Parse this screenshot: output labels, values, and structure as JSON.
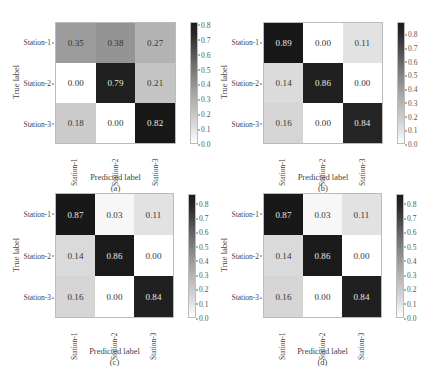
{
  "chart_data": [
    {
      "type": "heatmap",
      "panel": "(a)",
      "title": "",
      "xlabel": "Predicted label",
      "ylabel": "True label",
      "caption": "(a)",
      "x_categories": [
        "Station-1",
        "Station-2",
        "Station-3"
      ],
      "y_categories": [
        "Station-1",
        "Station-2",
        "Station-3"
      ],
      "values": [
        [
          0.35,
          0.38,
          0.27
        ],
        [
          0.0,
          0.79,
          0.21
        ],
        [
          0.18,
          0.0,
          0.82
        ]
      ],
      "display": [
        [
          "0.35",
          "0.38",
          "0.27"
        ],
        [
          "0.00",
          "0.79",
          "0.21"
        ],
        [
          "0.18",
          "0.00",
          "0.82"
        ]
      ],
      "colorbar": {
        "min": 0.0,
        "max": 0.82,
        "ticks": [
          "0.0",
          "0.1",
          "0.2",
          "0.3",
          "0.4",
          "0.5",
          "0.6",
          "0.7",
          "0.8"
        ],
        "cmap": "Greys"
      }
    },
    {
      "type": "heatmap",
      "panel": "(b)",
      "title": "",
      "xlabel": "Predicted label",
      "ylabel": "True label",
      "caption": "(b)",
      "x_categories": [
        "Station-1",
        "Station-2",
        "Station-3"
      ],
      "y_categories": [
        "Station-1",
        "Station-2",
        "Station-3"
      ],
      "values": [
        [
          0.89,
          0.0,
          0.11
        ],
        [
          0.14,
          0.86,
          0.0
        ],
        [
          0.16,
          0.0,
          0.84
        ]
      ],
      "display": [
        [
          "0.89",
          "0.00",
          "0.11"
        ],
        [
          "0.14",
          "0.86",
          "0.00"
        ],
        [
          "0.16",
          "0.00",
          "0.84"
        ]
      ],
      "colorbar": {
        "min": 0.0,
        "max": 0.89,
        "ticks": [
          "0.0",
          "0.1",
          "0.2",
          "0.3",
          "0.4",
          "0.5",
          "0.6",
          "0.7",
          "0.8"
        ],
        "cmap": "Greys"
      }
    },
    {
      "type": "heatmap",
      "panel": "(c)",
      "title": "",
      "xlabel": "Predicted label",
      "ylabel": "True label",
      "caption": "(c)",
      "x_categories": [
        "Station-1",
        "Station-2",
        "Station-3"
      ],
      "y_categories": [
        "Station-1",
        "Station-2",
        "Station-3"
      ],
      "values": [
        [
          0.87,
          0.03,
          0.11
        ],
        [
          0.14,
          0.86,
          0.0
        ],
        [
          0.16,
          0.0,
          0.84
        ]
      ],
      "display": [
        [
          "0.87",
          "0.03",
          "0.11"
        ],
        [
          "0.14",
          "0.86",
          "0.00"
        ],
        [
          "0.16",
          "0.00",
          "0.84"
        ]
      ],
      "colorbar": {
        "min": 0.0,
        "max": 0.87,
        "ticks": [
          "0.0",
          "0.1",
          "0.2",
          "0.3",
          "0.4",
          "0.5",
          "0.6",
          "0.7",
          "0.8"
        ],
        "cmap": "Greys"
      }
    },
    {
      "type": "heatmap",
      "panel": "(d)",
      "title": "",
      "xlabel": "Predicted label",
      "ylabel": "True label",
      "caption": "(d)",
      "x_categories": [
        "Station-1",
        "Station-2",
        "Station-3"
      ],
      "y_categories": [
        "Station-1",
        "Station-2",
        "Station-3"
      ],
      "values": [
        [
          0.87,
          0.03,
          0.11
        ],
        [
          0.14,
          0.86,
          0.0
        ],
        [
          0.16,
          0.0,
          0.84
        ]
      ],
      "display": [
        [
          "0.87",
          "0.03",
          "0.11"
        ],
        [
          "0.14",
          "0.86",
          "0.00"
        ],
        [
          "0.16",
          "0.00",
          "0.84"
        ]
      ],
      "colorbar": {
        "min": 0.0,
        "max": 0.87,
        "ticks": [
          "0.0",
          "0.1",
          "0.2",
          "0.3",
          "0.4",
          "0.5",
          "0.6",
          "0.7",
          "0.8"
        ],
        "cmap": "Greys"
      }
    }
  ],
  "layout": {
    "panels": [
      {
        "grid": {
          "left": 55,
          "top": 22,
          "width": 121,
          "height": 122
        },
        "cbar": {
          "left": 190,
          "top": 22,
          "height": 122
        }
      },
      {
        "grid": {
          "left": 263,
          "top": 22,
          "width": 120,
          "height": 122
        },
        "cbar": {
          "left": 397,
          "top": 22,
          "height": 122
        }
      },
      {
        "grid": {
          "left": 55,
          "top": 193,
          "width": 119,
          "height": 125
        },
        "cbar": {
          "left": 188,
          "top": 194,
          "height": 124
        }
      },
      {
        "grid": {
          "left": 263,
          "top": 193,
          "width": 119,
          "height": 125
        },
        "cbar": {
          "left": 396,
          "top": 194,
          "height": 124
        }
      }
    ]
  }
}
